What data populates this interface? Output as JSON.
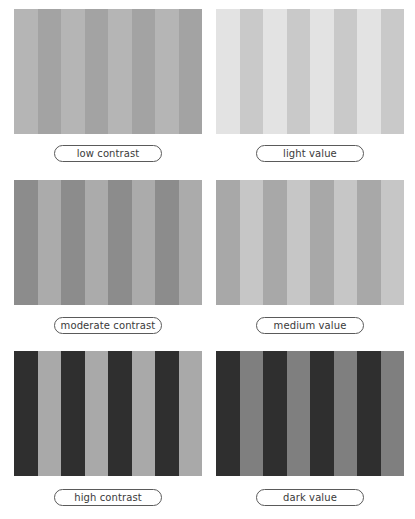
{
  "swatches": [
    {
      "label": "low contrast",
      "stripe_a": "#a3a3a3",
      "stripe_b": "#b5b5b5",
      "first": "b"
    },
    {
      "label": "light value",
      "stripe_a": "#c9c9c9",
      "stripe_b": "#e3e3e3",
      "first": "b"
    },
    {
      "label": "moderate contrast",
      "stripe_a": "#8c8c8c",
      "stripe_b": "#ababab",
      "first": "a"
    },
    {
      "label": "medium value",
      "stripe_a": "#a8a8a8",
      "stripe_b": "#c6c6c6",
      "first": "a"
    },
    {
      "label": "high contrast",
      "stripe_a": "#2f2f2f",
      "stripe_b": "#a9a9a9",
      "first": "a"
    },
    {
      "label": "dark value",
      "stripe_a": "#2f2f2f",
      "stripe_b": "#7f7f7f",
      "first": "a"
    }
  ],
  "stripe_count": 8
}
